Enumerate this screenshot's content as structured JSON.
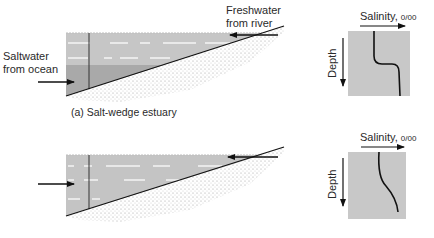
{
  "panel_a": {
    "caption": "(a) Salt-wedge estuary",
    "labels": {
      "saltwater_line1": "Saltwater",
      "saltwater_line2": "from ocean",
      "freshwater_line1": "Freshwater",
      "freshwater_line2": "from river"
    },
    "profile": {
      "x_label": "Salinity, ",
      "x_unit": "0/00",
      "y_label": "Depth",
      "shape": "sharp halocline at mid-depth"
    }
  },
  "panel_b": {
    "profile": {
      "x_label": "Salinity, ",
      "x_unit": "0/00",
      "y_label": "Depth",
      "shape": "gradual increase with depth"
    }
  },
  "colors": {
    "water_fresh": "#c6c6c6",
    "water_salt": "#a9a9a9",
    "profile_box": "#c8c8c8",
    "line": "#111111",
    "sediment_dots": "#8a8a8a"
  }
}
